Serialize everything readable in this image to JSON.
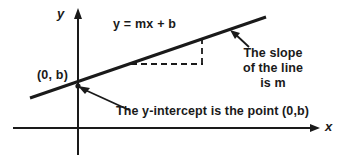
{
  "figure": {
    "type": "math-diagram",
    "background_color": "#ffffff",
    "ink_color": "#1a1a1a"
  },
  "axes": {
    "y_label": "y",
    "x_label": "x",
    "origin": {
      "x": 78,
      "y": 128
    },
    "x_axis": {
      "start_x": 13,
      "end_x": 320,
      "y": 128,
      "arrow": "right"
    },
    "y_axis": {
      "x": 78,
      "top_y": 10,
      "bottom_y": 155,
      "arrow": "up"
    }
  },
  "line": {
    "equation": "y = mx + b",
    "from": {
      "x": 30,
      "y": 98
    },
    "to": {
      "x": 266,
      "y": 17
    },
    "y_intercept_point": {
      "x": 78,
      "y": 86
    }
  },
  "slope_triangle": {
    "run": {
      "x1": 132,
      "y1": 64,
      "x2": 202,
      "y2": 64
    },
    "rise": {
      "x": 202,
      "y1": 64,
      "y2": 38
    },
    "style": "dashed"
  },
  "annotations": {
    "equation_label": "y = mx + b",
    "intercept_point_label": "(0, b)",
    "slope_note_lines": [
      "The slope",
      "of the line",
      "is m"
    ],
    "yintercept_note": "The y-intercept is the point (0,b)"
  },
  "arrows": [
    {
      "name": "slope-arrow",
      "tip": {
        "x": 231,
        "y": 31
      },
      "tail": {
        "x": 249,
        "y": 47
      }
    },
    {
      "name": "intercept-arrow",
      "tip": {
        "x": 80,
        "y": 87
      },
      "tail": {
        "x": 129,
        "y": 110
      }
    }
  ]
}
